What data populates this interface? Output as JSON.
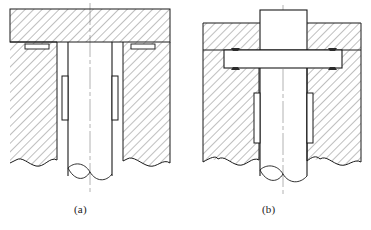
{
  "figure": {
    "type": "engineering-cross-section-drawing",
    "background_color": "#ffffff",
    "line_color": "#1a1a1a",
    "hatch_color": "#4a4a4a",
    "centerline_color": "#9a9a9a",
    "weld_mark_color": "#2b2b2b",
    "captions": [
      {
        "id": "a",
        "label": "(a)",
        "x": 74,
        "y": 203
      },
      {
        "id": "b",
        "label": "(b)",
        "x": 262,
        "y": 203
      }
    ],
    "views": [
      {
        "id": "a",
        "label": "(a)",
        "centerline_x": 90,
        "parts": [
          {
            "name": "upper-plate",
            "hatched": true
          },
          {
            "name": "lower-housing-left",
            "hatched": true
          },
          {
            "name": "lower-housing-right",
            "hatched": true
          },
          {
            "name": "shaft",
            "hatched": false
          },
          {
            "name": "groove-slot-left",
            "hatched": false
          },
          {
            "name": "groove-slot-right",
            "hatched": false
          },
          {
            "name": "bushing-left",
            "hatched": false
          },
          {
            "name": "bushing-right",
            "hatched": false
          },
          {
            "name": "wavy-break-line",
            "hatched": false
          },
          {
            "name": "shaft-break-ellipse",
            "hatched": false
          }
        ]
      },
      {
        "id": "b",
        "label": "(b)",
        "centerline_x": 283,
        "parts": [
          {
            "name": "shaft-boss-top",
            "hatched": false
          },
          {
            "name": "housing-upper-left",
            "hatched": true
          },
          {
            "name": "housing-upper-right",
            "hatched": true
          },
          {
            "name": "flange-plate",
            "hatched": false
          },
          {
            "name": "housing-lower-left",
            "hatched": true
          },
          {
            "name": "housing-lower-right",
            "hatched": true
          },
          {
            "name": "shaft",
            "hatched": false
          },
          {
            "name": "weld-mark-upper-left",
            "hatched": false
          },
          {
            "name": "weld-mark-upper-right",
            "hatched": false
          },
          {
            "name": "weld-mark-lower-left",
            "hatched": false
          },
          {
            "name": "weld-mark-lower-right",
            "hatched": false
          },
          {
            "name": "bushing-left",
            "hatched": false
          },
          {
            "name": "bushing-right",
            "hatched": false
          },
          {
            "name": "wavy-break-line",
            "hatched": false
          },
          {
            "name": "shaft-break-ellipse",
            "hatched": false
          }
        ]
      }
    ]
  }
}
